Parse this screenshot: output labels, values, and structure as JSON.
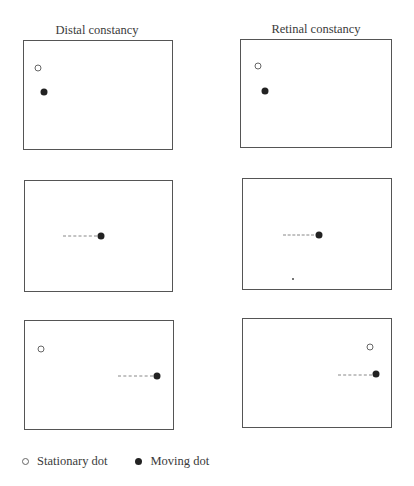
{
  "columns": [
    {
      "title": "Distal constancy"
    },
    {
      "title": "Retinal constancy"
    }
  ],
  "panels": [
    {
      "id": "distal-1",
      "box": [
        23,
        40,
        150,
        110
      ],
      "stationary": [
        38,
        68
      ],
      "moving": [
        44,
        92
      ],
      "trail": null
    },
    {
      "id": "retinal-1",
      "box": [
        240,
        39,
        152,
        109
      ],
      "stationary": [
        258,
        66
      ],
      "moving": [
        265,
        91
      ],
      "trail": null
    },
    {
      "id": "distal-2",
      "box": [
        24,
        180,
        149,
        112
      ],
      "stationary": null,
      "moving": [
        101,
        236
      ],
      "trail": [
        63,
        97,
        236
      ]
    },
    {
      "id": "retinal-2",
      "box": [
        242,
        178,
        150,
        112
      ],
      "stationary": null,
      "moving": [
        319,
        235
      ],
      "trail": [
        283,
        313,
        235
      ]
    },
    {
      "id": "distal-3",
      "box": [
        24,
        320,
        150,
        110
      ],
      "stationary": [
        41,
        349
      ],
      "moving": [
        157,
        376
      ],
      "trail": [
        118,
        152,
        376
      ]
    },
    {
      "id": "retinal-3",
      "box": [
        242,
        318,
        150,
        110
      ],
      "stationary": [
        370,
        347
      ],
      "moving": [
        376,
        374
      ],
      "trail": [
        338,
        371,
        375
      ]
    }
  ],
  "legend": {
    "stationary_label": "Stationary dot",
    "moving_label": "Moving dot"
  }
}
